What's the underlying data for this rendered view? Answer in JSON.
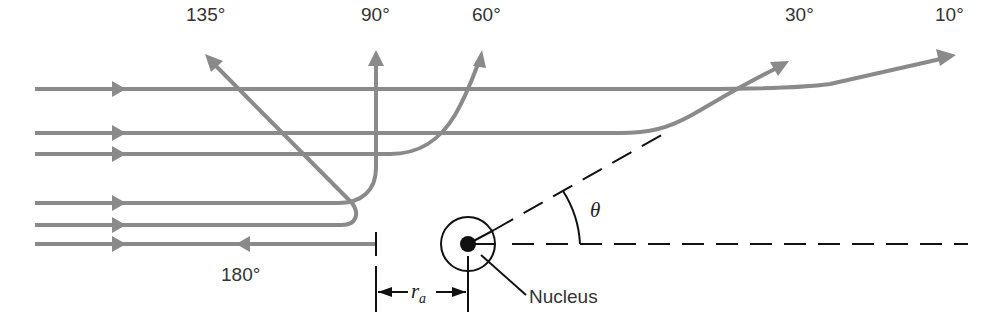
{
  "figure": {
    "colors": {
      "trajectory": "#8a8a8a",
      "ink": "#111111",
      "background": "#ffffff"
    },
    "trajectories": [
      {
        "id": "10",
        "label": "10°",
        "scatter_angle_deg": 10
      },
      {
        "id": "30",
        "label": "30°",
        "scatter_angle_deg": 30
      },
      {
        "id": "60",
        "label": "60°",
        "scatter_angle_deg": 60
      },
      {
        "id": "90",
        "label": "90°",
        "scatter_angle_deg": 90
      },
      {
        "id": "135",
        "label": "135°",
        "scatter_angle_deg": 135
      },
      {
        "id": "180",
        "label": "180°",
        "scatter_angle_deg": 180
      }
    ],
    "labels": {
      "l135": "135°",
      "l90": "90°",
      "l60": "60°",
      "l30": "30°",
      "l10": "10°",
      "l180": "180°",
      "nucleus": "Nucleus",
      "theta": "θ",
      "ra_main": "r",
      "ra_sub": "a"
    },
    "annotations": {
      "distance_of_closest_approach": "r_a",
      "angle_symbol": "θ"
    }
  }
}
